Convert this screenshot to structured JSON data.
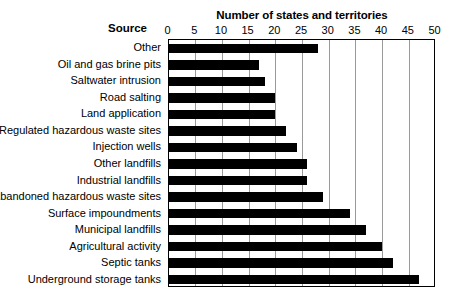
{
  "chart_data": {
    "type": "bar",
    "orientation": "horizontal",
    "title": "Number of states and territories",
    "xlabel": "Number of states and territories",
    "ylabel": "Source",
    "xlim": [
      0,
      50
    ],
    "xticks": [
      0,
      5,
      10,
      15,
      20,
      25,
      30,
      35,
      40,
      45,
      50
    ],
    "grid": true,
    "legend": "none",
    "bar_color": "#000000",
    "categories": [
      "Other",
      "Oil and gas brine pits",
      "Saltwater intrusion",
      "Road salting",
      "Land application",
      "Regulated hazardous waste sites",
      "Injection wells",
      "Other landfills",
      "Industrial landfills",
      "Abandoned hazardous waste sites",
      "Surface impoundments",
      "Municipal landfills",
      "Agricultural activity",
      "Septic tanks",
      "Underground storage tanks"
    ],
    "values": [
      28,
      17,
      18,
      20,
      20,
      22,
      24,
      26,
      26,
      29,
      34,
      37,
      40,
      42,
      47
    ]
  },
  "axis": {
    "title": "Number of states and territories",
    "source_header": "Source",
    "tick_labels": [
      "0",
      "5",
      "10",
      "15",
      "20",
      "25",
      "30",
      "35",
      "40",
      "45",
      "50"
    ]
  }
}
